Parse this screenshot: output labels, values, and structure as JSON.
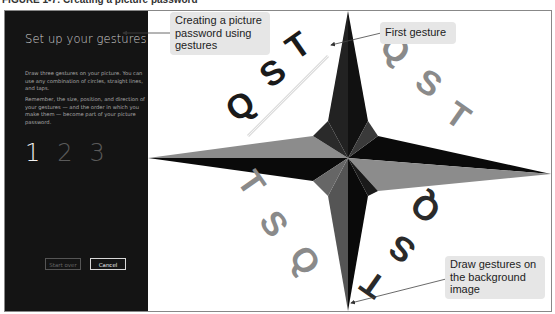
{
  "figure": {
    "caption": "FIGURE 1-7: Creating a picture password"
  },
  "panel": {
    "title": "Set up your gestures",
    "instructions": [
      "Draw three gestures on your picture. You can use any combination of circles, straight lines, and taps.",
      "Remember, the size, position, and direction of your gestures — and the order in which you make them — become part of your picture password."
    ],
    "steps": [
      {
        "label": "1",
        "state": "active"
      },
      {
        "label": "2",
        "state": "pending"
      },
      {
        "label": "3",
        "state": "pending"
      }
    ],
    "buttons": {
      "start_over": "Start over",
      "cancel": "Cancel"
    }
  },
  "picture": {
    "description": "Compass rose background image with Q S T letters",
    "letters": [
      "Q",
      "S",
      "T"
    ],
    "colors": {
      "star_dark": "#0a0a0a",
      "star_mid": "#555555",
      "star_light": "#8c8c8c",
      "letters_dark": "#1a1a1a",
      "letters_light": "#8a8a8a"
    }
  },
  "callouts": {
    "creating": "Creating a picture password using gestures",
    "first_gesture": "First gesture",
    "draw_gestures": "Draw gestures on the background image"
  }
}
